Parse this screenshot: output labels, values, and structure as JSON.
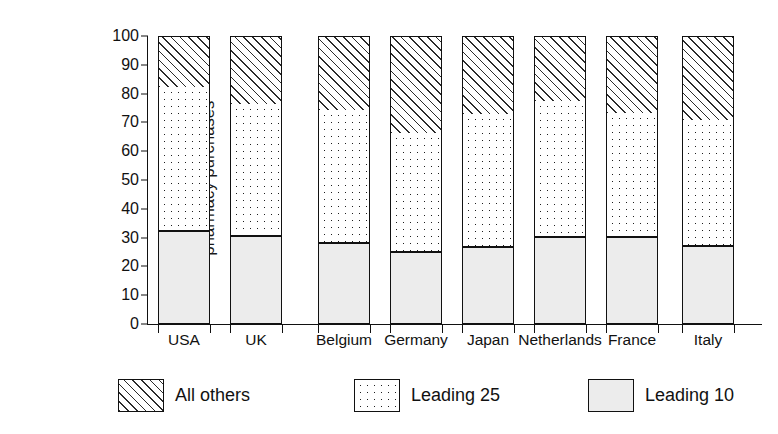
{
  "chart_data": {
    "type": "bar",
    "subtype": "stacked-bar-vertical",
    "title": "",
    "subtitle": "",
    "xlabel": "",
    "ylabel": "Market share in % of total pharmacy purchases",
    "ylabel_lines": [
      "Market share in % of total",
      "pharmacy purchases"
    ],
    "ylim": [
      0,
      100
    ],
    "ytick_values": [
      0,
      10,
      20,
      30,
      40,
      50,
      60,
      70,
      80,
      90,
      100
    ],
    "ytick_labels": [
      "0",
      "10",
      "20",
      "30",
      "40",
      "50",
      "60",
      "70",
      "80",
      "90",
      "100"
    ],
    "grid": false,
    "legend_position": "bottom",
    "stack_order_bottom_to_top": [
      "Leading 10",
      "Leading 25",
      "All others"
    ],
    "categories": [
      "USA",
      "UK",
      "Belgium",
      "Germany",
      "Japan",
      "Netherlands",
      "France",
      "Italy"
    ],
    "series": [
      {
        "name": "Leading 10",
        "pattern": "light-stipple",
        "color": "#ececec",
        "values": [
          32,
          30.5,
          28,
          25,
          26.5,
          30,
          30,
          27
        ]
      },
      {
        "name": "Leading 25",
        "pattern": "dotted",
        "color": "#ffffff",
        "values": [
          50.5,
          46,
          46.5,
          41.5,
          46.5,
          47.5,
          43.5,
          44
        ]
      },
      {
        "name": "All others",
        "pattern": "diagonal-hatch",
        "color": "#ffffff",
        "values": [
          17.5,
          23.5,
          25.5,
          33.5,
          27,
          22.5,
          26.5,
          29
        ]
      }
    ],
    "cumulative_tops": {
      "leading_10": [
        32,
        30.5,
        28,
        25,
        26.5,
        30,
        30,
        27
      ],
      "leading_25": [
        82.5,
        76.5,
        74.5,
        66.5,
        73,
        77.5,
        73.5,
        71
      ],
      "all_others": [
        100,
        100,
        100,
        100,
        100,
        100,
        100,
        100
      ]
    }
  },
  "legend": {
    "items": [
      {
        "label": "All others",
        "swatch": "diagonal-hatch-swatch"
      },
      {
        "label": "Leading 25",
        "swatch": "dotted-swatch"
      },
      {
        "label": "Leading 10",
        "swatch": "stipple-swatch"
      }
    ]
  }
}
